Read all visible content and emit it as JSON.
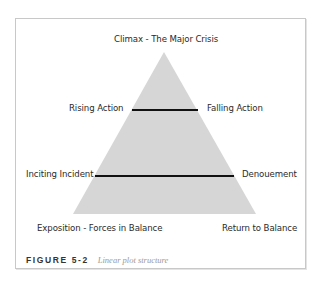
{
  "diagram": {
    "type": "plot-structure-pyramid",
    "labels": {
      "apex": "Climax - The Major Crisis",
      "upper_left": "Rising Action",
      "upper_right": "Falling Action",
      "lower_left": "Inciting Incident",
      "lower_right": "Denouement",
      "base_left": "Exposition - Forces in Balance",
      "base_right": "Return to Balance"
    },
    "colors": {
      "triangle_fill": "#d6d6d6",
      "divider_line": "#111111",
      "frame_border": "#c8c8c8"
    }
  },
  "caption": {
    "figure_number": "FIGURE 5-2",
    "text": "Linear plot structure"
  }
}
